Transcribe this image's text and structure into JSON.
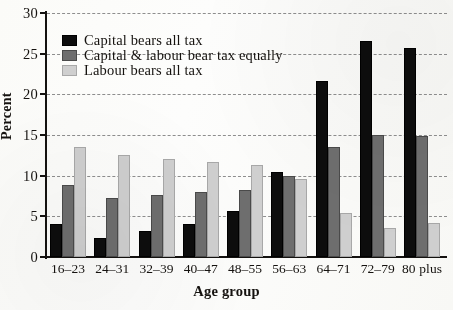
{
  "chart_data": {
    "type": "bar",
    "title": "",
    "xlabel": "Age group",
    "ylabel": "Percent",
    "categories": [
      "16–23",
      "24–31",
      "32–39",
      "40–47",
      "48–55",
      "56–63",
      "64–71",
      "72–79",
      "80 plus"
    ],
    "series": [
      {
        "name": "Capital bears all tax",
        "color": "#0d0d0d",
        "values": [
          4.1,
          2.3,
          3.2,
          4.1,
          5.6,
          10.4,
          21.7,
          26.5,
          25.7
        ]
      },
      {
        "name": "Capital & labour bear tax equally",
        "color": "#6e6e6e",
        "values": [
          8.8,
          7.3,
          7.6,
          8.0,
          8.3,
          9.9,
          13.5,
          15.0,
          14.9
        ]
      },
      {
        "name": "Labour bears all tax",
        "color": "#cfcfcf",
        "values": [
          13.5,
          12.5,
          12.0,
          11.7,
          11.3,
          9.6,
          5.4,
          3.6,
          4.2
        ]
      }
    ],
    "ylim": [
      0,
      30
    ],
    "yticks": [
      0,
      5,
      10,
      15,
      20,
      25,
      30
    ],
    "ytick_labels": [
      "0",
      "5",
      "10",
      "15",
      "20",
      "25",
      "30"
    ],
    "grid": "horizontal-dashed",
    "legend_position": "upper-left-inside"
  },
  "legend": {
    "items": [
      {
        "label": "Capital bears all tax"
      },
      {
        "label": "Capital & labour bear tax equally"
      },
      {
        "label": "Labour bears all tax"
      }
    ]
  }
}
